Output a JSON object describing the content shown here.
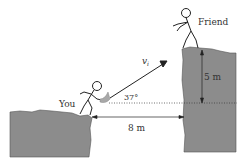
{
  "diagram": {
    "labels": {
      "you": "You",
      "friend": "Friend",
      "velocity": "v",
      "velocity_sub": "i",
      "angle": "37°",
      "height": "5 m",
      "distance": "8 m"
    },
    "colors": {
      "cliff": "#8c8c8c",
      "ink": "#222222",
      "ball": "#a8a8a8"
    }
  }
}
